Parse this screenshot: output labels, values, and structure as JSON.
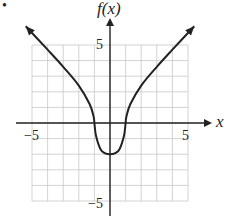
{
  "chart_data": {
    "type": "line",
    "title": "",
    "xlabel": "x",
    "ylabel": "f(x)",
    "xlim": [
      -5,
      5
    ],
    "ylim": [
      -5,
      5
    ],
    "grid": true,
    "x_tick_labels": [
      "-5",
      "5"
    ],
    "y_tick_labels": [
      "5",
      "-5"
    ],
    "series": [
      {
        "name": "f(x)",
        "x": [
          -5.4,
          -4,
          -3,
          -2,
          -1.3,
          -1.05,
          -1,
          -0.9,
          -0.6,
          -0.3,
          0,
          0.3,
          0.6,
          0.9,
          1,
          1.05,
          1.3,
          2,
          3,
          4,
          5.4
        ],
        "y": [
          6.2,
          4.7,
          3.6,
          2.4,
          1.2,
          0.4,
          0,
          -0.8,
          -1.7,
          -1.95,
          -2,
          -1.95,
          -1.7,
          -0.8,
          0,
          0.4,
          1.2,
          2.4,
          3.6,
          4.7,
          6.2
        ]
      }
    ],
    "annotations": [
      "arrowheads at both curve ends",
      "bullet marker at top-left"
    ]
  },
  "labels": {
    "y_axis": "f(x)",
    "x_axis": "x",
    "x_min": "−5",
    "x_max": "5",
    "y_max": "5",
    "y_min": "−5",
    "bullet": "•"
  }
}
